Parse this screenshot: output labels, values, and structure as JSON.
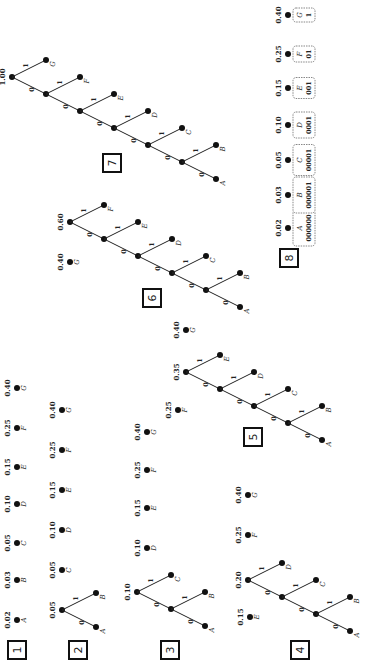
{
  "steps": [
    {
      "label": "1"
    },
    {
      "label": "2"
    },
    {
      "label": "3"
    },
    {
      "label": "4"
    },
    {
      "label": "5"
    },
    {
      "label": "6"
    },
    {
      "label": "7"
    },
    {
      "label": "8"
    }
  ],
  "symbols": [
    {
      "sym": "A",
      "prob": "0.02",
      "code": "000000"
    },
    {
      "sym": "B",
      "prob": "0.03",
      "code": "000001"
    },
    {
      "sym": "C",
      "prob": "0.05",
      "code": "00001"
    },
    {
      "sym": "D",
      "prob": "0.10",
      "code": "0001"
    },
    {
      "sym": "E",
      "prob": "0.15",
      "code": "001"
    },
    {
      "sym": "F",
      "prob": "0.25",
      "code": "01"
    },
    {
      "sym": "G",
      "prob": "0.40",
      "code": "1"
    }
  ],
  "internal_nodes": {
    "AB": "0.05",
    "ABC": "0.10",
    "ABCD": "0.20",
    "ABCDE": "0.35",
    "ABCDEF": "0.60",
    "root": "1.00"
  },
  "edge_bits": {
    "left": "0",
    "right": "1"
  }
}
